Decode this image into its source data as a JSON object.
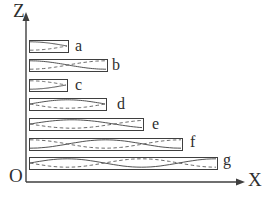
{
  "diagram": {
    "background": "#ffffff",
    "stroke_color": "#3f3f3f",
    "dashed_color": "#5a5a5a",
    "label_color": "#2e2e2e",
    "axes": {
      "z_label": "Z",
      "x_label": "X",
      "origin_label": "O",
      "z_axis": {
        "x": 26,
        "y_tip": 12,
        "y_bottom": 182
      },
      "x_axis": {
        "y": 182,
        "x_left": 26,
        "x_tip": 245
      }
    },
    "bars": [
      {
        "label": "a",
        "x": 29,
        "y": 40,
        "width": 39,
        "height": 12,
        "pattern": "quarter-wave, envelope converges at right end",
        "wave": {
          "type": "cos",
          "k": 0.5,
          "sign": 1
        },
        "label_pos": {
          "left": 75,
          "top": 38
        }
      },
      {
        "label": "b",
        "x": 29,
        "y": 59,
        "width": 78,
        "height": 12,
        "pattern": "half-wave, solid and dashed cross at center",
        "wave": {
          "type": "cos",
          "k": 1,
          "sign": 1
        },
        "label_pos": {
          "left": 112,
          "top": 57
        }
      },
      {
        "label": "c",
        "x": 29,
        "y": 79,
        "width": 38,
        "height": 12,
        "pattern": "quarter-wave flipped, envelope converges at right end",
        "wave": {
          "type": "cos",
          "k": 0.5,
          "sign": -1
        },
        "label_pos": {
          "left": 75,
          "top": 77
        }
      },
      {
        "label": "d",
        "x": 29,
        "y": 98,
        "width": 77,
        "height": 12,
        "pattern": "single antinode bulge, nodes at both ends",
        "wave": {
          "type": "sin",
          "k": 1,
          "sign": 1
        },
        "label_pos": {
          "left": 117,
          "top": 96
        }
      },
      {
        "label": "e",
        "x": 29,
        "y": 118,
        "width": 114,
        "height": 12,
        "pattern": "node at left and at three-quarters, open at right",
        "wave": {
          "type": "sin",
          "k": 1.3333,
          "sign": 1
        },
        "label_pos": {
          "left": 152,
          "top": 116
        }
      },
      {
        "label": "f",
        "x": 29,
        "y": 138,
        "width": 153,
        "height": 12,
        "pattern": "full wave, crossings at one-quarter and three-quarters",
        "wave": {
          "type": "cos",
          "k": 2,
          "sign": -1
        },
        "label_pos": {
          "left": 190,
          "top": 134
        }
      },
      {
        "label": "g",
        "x": 29,
        "y": 157,
        "width": 188,
        "height": 12,
        "pattern": "one-and-a-quarter wave, crossings at 0.4 and 0.8 of length",
        "wave": {
          "type": "sin",
          "k": 2.5,
          "sign": 1
        },
        "label_pos": {
          "left": 223,
          "top": 152
        }
      }
    ]
  }
}
